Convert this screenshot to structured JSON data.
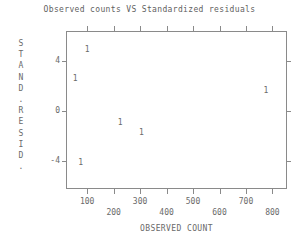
{
  "chart_data": {
    "type": "scatter",
    "title": "Observed counts VS Standardized residuals",
    "xlabel": "OBSERVED COUNT",
    "ylabel": "STAND. RESID.",
    "ylabel_chars": [
      "S",
      "T",
      "A",
      "N",
      "D",
      ".",
      "R",
      "E",
      "S",
      "I",
      "D",
      "."
    ],
    "xlim": [
      20,
      855
    ],
    "ylim": [
      -6.2,
      6.4
    ],
    "xticks": [
      100,
      200,
      300,
      400,
      500,
      600,
      700,
      800
    ],
    "xtick_labels": [
      "100",
      "200",
      "300",
      "400",
      "500",
      "600",
      "700",
      "800"
    ],
    "xtick_rows": [
      0,
      1,
      0,
      1,
      0,
      1,
      0,
      1
    ],
    "yticks": [
      4,
      0,
      -4
    ],
    "ytick_labels": [
      "4",
      "0",
      "-4"
    ],
    "grid": false,
    "legend": null,
    "marker_label": "1",
    "points": [
      {
        "x": 100,
        "y": 4.9,
        "label": "1"
      },
      {
        "x": 55,
        "y": 2.6,
        "label": "1"
      },
      {
        "x": 775,
        "y": 1.6,
        "label": "1"
      },
      {
        "x": 225,
        "y": -0.95,
        "label": "1"
      },
      {
        "x": 305,
        "y": -1.7,
        "label": "1"
      },
      {
        "x": 75,
        "y": -4.1,
        "label": "1"
      }
    ]
  },
  "colors": {
    "background": "#ffffff",
    "axis": "#8a8a8a",
    "text": "#6a6a6a",
    "title": "#5f5f5f"
  }
}
